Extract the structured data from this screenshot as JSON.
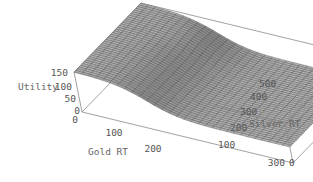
{
  "chart_data": {
    "type": "surface3d",
    "title": "",
    "axes": {
      "x": {
        "label": "Gold RT",
        "range": [
          0,
          300
        ],
        "ticks": [
          "0",
          "100",
          "200",
          "300"
        ]
      },
      "y": {
        "label": "Silver RT",
        "range": [
          0,
          500
        ],
        "ticks": [
          "0",
          "100",
          "200",
          "300",
          "400",
          "500"
        ]
      },
      "z": {
        "label": "Utility",
        "range": [
          0,
          150
        ],
        "ticks": [
          "0",
          "50",
          "100",
          "150"
        ]
      }
    },
    "surface_description": "Utility is ~150 at low Gold RT, drops via a sigmoid transition around Gold RT ~100 to a plateau of ~60 at high Gold RT; a slight ridge/bump appears along high Silver RT near the transition.",
    "grid": {
      "nx": 30,
      "ny": 40
    },
    "surface_params": {
      "high": 150,
      "low": 60,
      "center_gold": 100,
      "width_gold": 22,
      "ridge_amp": 12,
      "ridge_center_silver": 420,
      "ridge_width_silver": 90
    },
    "box": true,
    "colors": {
      "surface": "#b4b4b4",
      "mesh": "#3a3a3a",
      "box": "#8a8a8a",
      "text": "#555555"
    }
  }
}
